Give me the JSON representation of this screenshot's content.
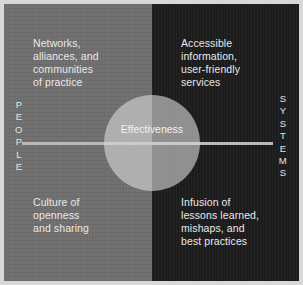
{
  "diagram": {
    "center": {
      "label": "Effectiveness"
    },
    "axis": {
      "left_label": "PEOPLE",
      "right_label": "SYSTEMS"
    },
    "quadrants": [
      {
        "position": "top-left",
        "side": "people",
        "text": "Networks,\nalliances, and\ncommunities\nof practice"
      },
      {
        "position": "top-right",
        "side": "systems",
        "text": "Accessible\ninformation,\nuser-friendly\nservices"
      },
      {
        "position": "bottom-left",
        "side": "people",
        "text": "Culture of\nopenness\nand sharing"
      },
      {
        "position": "bottom-right",
        "side": "systems",
        "text": "Infusion of\nlessons learned,\nmishaps, and\nbest practices"
      }
    ],
    "colors": {
      "left_background": "#6f6f6f",
      "right_background": "#1c1c1c",
      "circle": "#d7d7d7",
      "axis_line": "#b9b9b9",
      "text": "#e9e9e9",
      "outer_frame": "#d8d8d8"
    }
  }
}
